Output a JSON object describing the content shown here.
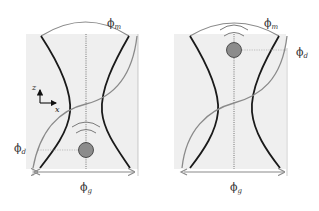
{
  "colors": {
    "background": "#ffffff",
    "panel_fill": "#efefef",
    "beam_edge": "#1a1a1a",
    "phase_curve": "#8a8a8a",
    "particle_fill": "#8c8c8c",
    "guide_line": "#9a9a9a",
    "wave_arc": "#7a7a7a"
  },
  "panels": [
    {
      "id": "left",
      "labels": {
        "phi_m": {
          "base": "ϕ",
          "sub": "m"
        },
        "phi_d": {
          "base": "ϕ",
          "sub": "d"
        },
        "phi_g": {
          "base": "ϕ",
          "sub": "g"
        }
      },
      "particle_position": "below-waist",
      "axes": {
        "z": "z",
        "x": "x"
      }
    },
    {
      "id": "right",
      "labels": {
        "phi_m": {
          "base": "ϕ",
          "sub": "m"
        },
        "phi_d": {
          "base": "ϕ",
          "sub": "d"
        },
        "phi_g": {
          "base": "ϕ",
          "sub": "g"
        }
      },
      "particle_position": "above-waist"
    }
  ]
}
